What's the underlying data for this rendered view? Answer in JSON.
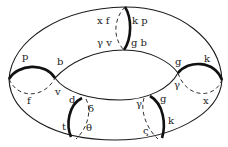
{
  "diagram": {
    "type": "torus-surface-with-labeled-cuts",
    "colors": {
      "stroke": "#1a1a1a",
      "background": "#ffffff"
    },
    "labels": {
      "top_left_upper": "x f",
      "top_right_upper": "k p",
      "top_left_lower": "γ v",
      "top_right_lower": "g b",
      "left_outer": "p",
      "left_inner_top": "b",
      "left_inner_bottom": "v",
      "left_dashed": "f",
      "right_inner_top": "g",
      "right_outer": "k",
      "right_inner_bottom": "γ",
      "right_dashed": "x",
      "bl_top": "d",
      "bl_bottom": "t",
      "bl_dash_top": "δ",
      "bl_dash_bottom": "θ",
      "br_dash_top": "γ",
      "br_top": "g",
      "br_bottom": "k",
      "br_dash_bottom": "ς"
    }
  }
}
